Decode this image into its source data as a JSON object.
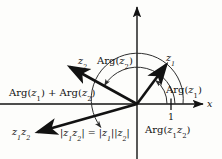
{
  "figure": {
    "background_color": "#fdfdfb",
    "stroke_color": "#121212",
    "arc_color": "#3a3a3a"
  },
  "axes": {
    "x_axis_label": "x",
    "y_axis_label": "",
    "tick_label_1": "1",
    "origin": {
      "x": 137,
      "y": 104
    }
  },
  "vectors": [
    {
      "name": "z1",
      "label": "z₁",
      "label_text": "z",
      "label_sub": "1",
      "tip": {
        "x": 165,
        "y": 64
      }
    },
    {
      "name": "z2",
      "label": "z₂",
      "label_text": "z",
      "label_sub": "2",
      "tip": {
        "x": 69,
        "y": 66
      }
    },
    {
      "name": "z1z2",
      "label": "z₁z₂",
      "label_text": "z",
      "label_sub": "1",
      "label_text2": "z",
      "label_sub2": "2",
      "tip": {
        "x": 37,
        "y": 132
      }
    }
  ],
  "arcs": [
    {
      "name": "arg-z1",
      "label_prefix": "Arg(",
      "label_var": "z",
      "label_sub": "1",
      "label_suffix": ")"
    },
    {
      "name": "arg-z2",
      "label_prefix": "Arg(",
      "label_var": "z",
      "label_sub": "2",
      "label_suffix": ")"
    },
    {
      "name": "arg-z1z2",
      "label_prefix": "Arg(",
      "label_var": "z",
      "label_sub": "1",
      "label_var2": "z",
      "label_sub2": "2",
      "label_suffix": ")"
    }
  ],
  "labels": {
    "arg_sum_prefix": "Arg(",
    "arg_sum_var1": "z",
    "arg_sum_sub1": "1",
    "arg_sum_mid": ")  +  Arg(",
    "arg_sum_var2": "z",
    "arg_sum_sub2": "2",
    "arg_sum_suffix": ")",
    "modulus_eq_open": "|",
    "modulus_eq_a1": "z",
    "modulus_eq_a1s": "1",
    "modulus_eq_a2": "z",
    "modulus_eq_a2s": "2",
    "modulus_eq_close": "|",
    "modulus_eq_equals": "=",
    "modulus_eq_b1": "z",
    "modulus_eq_b1s": "1",
    "modulus_eq_b2": "z",
    "modulus_eq_b2s": "2"
  }
}
